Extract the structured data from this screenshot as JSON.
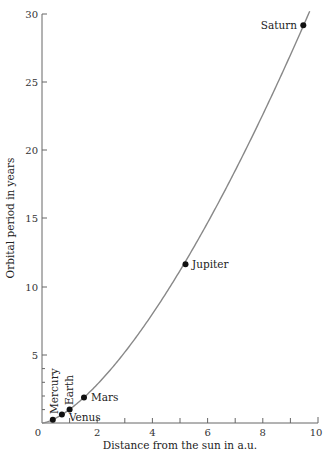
{
  "chart_data": {
    "type": "scatter",
    "title": "",
    "xlabel": "Distance from the sun in a.u.",
    "ylabel": "Orbital period in years",
    "xlim": [
      0,
      10
    ],
    "ylim": [
      0,
      30
    ],
    "xticks": [
      0,
      2,
      4,
      6,
      8,
      10
    ],
    "yticks": [
      5,
      10,
      15,
      20,
      25,
      30
    ],
    "grid": false,
    "legend": null,
    "series": [
      {
        "name": "Planets",
        "points": [
          {
            "label": "Mercury",
            "x": 0.39,
            "y": 0.24
          },
          {
            "label": "Venus",
            "x": 0.72,
            "y": 0.62
          },
          {
            "label": "Earth",
            "x": 1.0,
            "y": 1.0
          },
          {
            "label": "Mars",
            "x": 1.52,
            "y": 1.88
          },
          {
            "label": "Jupiter",
            "x": 5.2,
            "y": 11.86
          },
          {
            "label": "Saturn",
            "x": 9.54,
            "y": 29.46
          }
        ]
      }
    ],
    "curve": {
      "name": "T = a^1.5",
      "x_range": [
        0,
        9.7
      ]
    }
  },
  "labels": {
    "xlabel": "Distance from the sun in a.u.",
    "ylabel": "Orbital period in years",
    "x0": "0",
    "x2": "2",
    "x4": "4",
    "x6": "6",
    "x8": "8",
    "x10": "10",
    "y5": "5",
    "y10": "10",
    "y15": "15",
    "y20": "20",
    "y25": "25",
    "y30": "30",
    "mercury": "Mercury",
    "venus": "Venus",
    "earth": "Earth",
    "mars": "Mars",
    "jupiter": "Jupiter",
    "saturn": "Saturn"
  },
  "colors": {
    "curve": "#888888",
    "axis": "#666666",
    "point": "#111111"
  }
}
